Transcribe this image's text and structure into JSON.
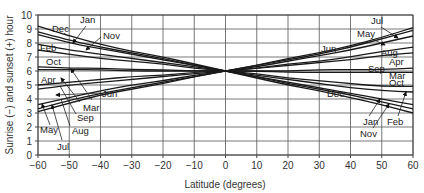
{
  "chart_data": {
    "type": "line",
    "title": "",
    "xlabel": "Latitude (degrees)",
    "ylabel": "Sunrise (−) and sunset (+) hour",
    "xlim": [
      -60,
      60
    ],
    "ylim": [
      0,
      10
    ],
    "grid": true,
    "legend": "none (curves labeled by inline annotations with arrows)",
    "x_ticks": [
      "-60",
      "-50",
      "-40",
      "-30",
      "-20",
      "-10",
      "0",
      "10",
      "20",
      "30",
      "40",
      "50",
      "60"
    ],
    "x_tick_labels": [
      "−60",
      "−50",
      "−40",
      "−30",
      "−20",
      "−10",
      "0",
      "10",
      "20",
      "30",
      "40",
      "50",
      "60"
    ],
    "y_ticks": [
      0,
      1,
      2,
      3,
      4,
      5,
      6,
      7,
      8,
      9,
      10
    ],
    "x": [
      -60,
      -50,
      -40,
      -30,
      -20,
      -10,
      0,
      10,
      20,
      30,
      40,
      50,
      60
    ],
    "series": [
      {
        "name": "Dec",
        "values": [
          9.2,
          8.5,
          7.9,
          7.4,
          7.0,
          6.5,
          6.0,
          5.5,
          5.0,
          4.6,
          4.1,
          3.6,
          3.0
        ]
      },
      {
        "name": "Jan",
        "values": [
          8.8,
          8.2,
          7.7,
          7.3,
          6.9,
          6.4,
          6.0,
          5.6,
          5.1,
          4.7,
          4.3,
          3.8,
          3.3
        ]
      },
      {
        "name": "Nov",
        "values": [
          8.6,
          8.0,
          7.6,
          7.2,
          6.8,
          6.4,
          6.0,
          5.6,
          5.2,
          4.8,
          4.4,
          4.0,
          3.6
        ]
      },
      {
        "name": "Feb",
        "values": [
          7.9,
          7.5,
          7.2,
          6.9,
          6.6,
          6.3,
          6.0,
          5.7,
          5.4,
          5.1,
          4.8,
          4.6,
          4.5
        ]
      },
      {
        "name": "Oct",
        "values": [
          7.5,
          7.2,
          6.9,
          6.7,
          6.5,
          6.2,
          6.0,
          5.8,
          5.5,
          5.3,
          5.1,
          4.9,
          4.9
        ]
      },
      {
        "name": "Mar",
        "values": [
          6.3,
          6.2,
          6.2,
          6.1,
          6.1,
          6.0,
          6.0,
          6.0,
          5.9,
          5.9,
          5.9,
          5.9,
          5.9
        ]
      },
      {
        "name": "Sep",
        "values": [
          6.1,
          6.1,
          6.1,
          6.0,
          6.0,
          6.0,
          6.0,
          6.0,
          6.0,
          6.1,
          6.1,
          6.1,
          6.2
        ]
      },
      {
        "name": "Apr",
        "values": [
          5.0,
          5.2,
          5.4,
          5.6,
          5.7,
          5.9,
          6.0,
          6.2,
          6.4,
          6.6,
          6.8,
          7.1,
          7.3
        ]
      },
      {
        "name": "Aug",
        "values": [
          4.7,
          5.0,
          5.2,
          5.4,
          5.6,
          5.8,
          6.0,
          6.2,
          6.5,
          6.7,
          7.0,
          7.4,
          7.7
        ]
      },
      {
        "name": "May",
        "values": [
          3.6,
          4.1,
          4.6,
          5.0,
          5.3,
          5.7,
          6.0,
          6.3,
          6.7,
          7.1,
          7.5,
          8.0,
          8.5
        ]
      },
      {
        "name": "Jul",
        "values": [
          3.3,
          3.9,
          4.4,
          4.8,
          5.2,
          5.6,
          6.0,
          6.4,
          6.8,
          7.2,
          7.7,
          8.3,
          8.9
        ]
      },
      {
        "name": "Jun",
        "values": [
          3.1,
          3.7,
          4.3,
          4.7,
          5.1,
          5.6,
          6.0,
          6.4,
          6.9,
          7.3,
          7.8,
          8.4,
          9.1
        ]
      }
    ],
    "annotations": [
      {
        "text": "Dec",
        "side": "south"
      },
      {
        "text": "Jan",
        "side": "south"
      },
      {
        "text": "Nov",
        "side": "south"
      },
      {
        "text": "Feb",
        "side": "south"
      },
      {
        "text": "Oct",
        "side": "south"
      },
      {
        "text": "Apr",
        "side": "south"
      },
      {
        "text": "Mar",
        "side": "south"
      },
      {
        "text": "Jun",
        "side": "south"
      },
      {
        "text": "Sep",
        "side": "south"
      },
      {
        "text": "May",
        "side": "south"
      },
      {
        "text": "Aug",
        "side": "south"
      },
      {
        "text": "Jul",
        "side": "south"
      },
      {
        "text": "Jul",
        "side": "north"
      },
      {
        "text": "May",
        "side": "north"
      },
      {
        "text": "Jun",
        "side": "north"
      },
      {
        "text": "Aug",
        "side": "north"
      },
      {
        "text": "Apr",
        "side": "north"
      },
      {
        "text": "Sep",
        "side": "north"
      },
      {
        "text": "Mar",
        "side": "north"
      },
      {
        "text": "Oct",
        "side": "north"
      },
      {
        "text": "Dec",
        "side": "north"
      },
      {
        "text": "Jan",
        "side": "north"
      },
      {
        "text": "Nov",
        "side": "north"
      },
      {
        "text": "Feb",
        "side": "north"
      }
    ]
  },
  "labels": {
    "xlabel": "Latitude (degrees)",
    "ylabel": "Sunrise (−) and sunset (+) hour",
    "south": {
      "dec": "Dec",
      "jan": "Jan",
      "nov": "Nov",
      "feb": "Feb",
      "oct": "Oct",
      "apr": "Apr",
      "mar": "Mar",
      "jun": "Jun",
      "sep": "Sep",
      "may": "May",
      "aug": "Aug",
      "jul": "Jul"
    },
    "north": {
      "jul": "Jul",
      "may": "May",
      "jun": "Jun",
      "aug": "Aug",
      "apr": "Apr",
      "sep": "Sep",
      "mar": "Mar",
      "oct": "Oct",
      "dec": "Dec",
      "jan": "Jan",
      "nov": "Nov",
      "feb": "Feb"
    }
  },
  "colors": {
    "curve": "#1a1a1a",
    "grid": "#555555",
    "background": "#ffffff"
  }
}
